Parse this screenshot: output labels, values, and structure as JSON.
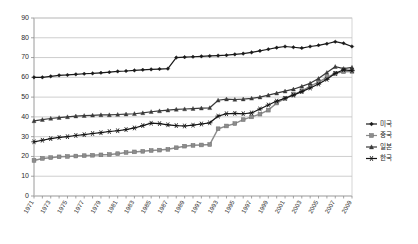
{
  "chart_data": {
    "type": "line",
    "title": "",
    "xlabel": "",
    "ylabel": "",
    "ylim": [
      0,
      90
    ],
    "ytick_step": 10,
    "yticks": [
      0,
      10,
      20,
      30,
      40,
      50,
      60,
      70,
      80,
      90
    ],
    "grid": true,
    "legend_position": "right",
    "x": [
      1971,
      1972,
      1973,
      1974,
      1975,
      1976,
      1977,
      1978,
      1979,
      1980,
      1981,
      1982,
      1983,
      1984,
      1985,
      1986,
      1987,
      1988,
      1989,
      1990,
      1991,
      1992,
      1993,
      1994,
      1995,
      1996,
      1997,
      1998,
      1999,
      2000,
      2001,
      2002,
      2003,
      2004,
      2005,
      2006,
      2007,
      2008,
      2009
    ],
    "xtick_labels": [
      "1971",
      "1973",
      "1975",
      "1977",
      "1979",
      "1981",
      "1983",
      "1985",
      "1987",
      "1989",
      "1991",
      "1993",
      "1995",
      "1997",
      "1999",
      "2001",
      "2003",
      "2005",
      "2007",
      "2009"
    ],
    "series": [
      {
        "name": "미국",
        "marker": "diamond",
        "color": "#1a1a1a",
        "values": [
          60,
          60,
          60.5,
          61,
          61.2,
          61.5,
          61.8,
          62,
          62.3,
          62.6,
          63,
          63.2,
          63.5,
          63.8,
          64,
          64.2,
          64.4,
          70,
          70.2,
          70.4,
          70.6,
          70.8,
          71,
          71.2,
          71.6,
          72,
          72.6,
          73.4,
          74.2,
          75,
          75.6,
          75.2,
          74.8,
          75.6,
          76.2,
          77,
          78,
          77.2,
          75.6
        ]
      },
      {
        "name": "중국",
        "marker": "square",
        "color": "#8c8c8c",
        "values": [
          18,
          19,
          19.4,
          19.8,
          20,
          20.2,
          20.4,
          20.6,
          20.8,
          21,
          21.4,
          22,
          22.3,
          22.6,
          23,
          23.2,
          23.6,
          24.4,
          25.2,
          25.6,
          25.8,
          26,
          34,
          35.4,
          36.6,
          38.6,
          40,
          41.4,
          43.4,
          47,
          49.4,
          51.4,
          53,
          55.6,
          57.6,
          60,
          62,
          62.8,
          63
        ]
      },
      {
        "name": "일본",
        "marker": "triangle",
        "color": "#3a3a3a",
        "values": [
          38,
          38.6,
          39.2,
          39.6,
          40,
          40.4,
          40.6,
          40.8,
          41,
          41,
          41.2,
          41.4,
          41.6,
          42,
          42.6,
          43,
          43.4,
          43.8,
          44,
          44.2,
          44.4,
          44.6,
          48.4,
          49,
          48.8,
          49,
          49.4,
          50,
          51,
          52,
          53,
          54,
          55.4,
          57,
          59.4,
          62.4,
          65.4,
          64.4,
          65
        ]
      },
      {
        "name": "한국",
        "marker": "star",
        "color": "#141414",
        "values": [
          27.4,
          28.2,
          29,
          29.6,
          30,
          30.6,
          31,
          31.6,
          32,
          32.6,
          33,
          33.6,
          34.4,
          35.6,
          36.8,
          36.6,
          36,
          35.6,
          35.4,
          35.8,
          36.4,
          37,
          40.4,
          41.6,
          41.8,
          41.6,
          42,
          44,
          46,
          48,
          49.4,
          51,
          52.8,
          54.6,
          56.6,
          59,
          62,
          63.8,
          63.4
        ]
      }
    ]
  }
}
